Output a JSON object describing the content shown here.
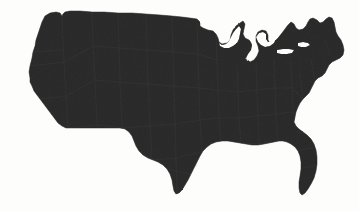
{
  "figure": {
    "kind": "map-image",
    "subject": "Contiguous United States",
    "title": "",
    "caption": "",
    "alt_text": "Solid dark silhouette map of the contiguous United States with faint state boundary lines"
  },
  "canvas": {
    "width": 359,
    "height": 212,
    "background_color": "#fdfdfc"
  },
  "style": {
    "land_fill_color": "#333333",
    "land_fill_color_dark": "#262626",
    "state_border_color": "#5a5a5a",
    "state_border_width": 0.6,
    "water_color": "#fdfdfc",
    "outline_color": "#2b2b2b",
    "texture": "noisy-dithered-scan"
  },
  "extent": {
    "left_px": 27,
    "top_px": 11,
    "right_px": 345,
    "bottom_px": 196
  },
  "features": {
    "landmass_label": "contiguous-united-states",
    "visible_landmarks": [
      "Puget Sound notch",
      "California coastline",
      "Baja California notch",
      "Gulf of Mexico coastline",
      "Texas southern tip",
      "Florida peninsula",
      "Chesapeake Bay",
      "Cape Cod",
      "Long Island",
      "Maine northeast projection",
      "Great Lakes"
    ],
    "great_lakes": [
      "Lake Superior",
      "Lake Michigan",
      "Lake Huron",
      "Lake Erie",
      "Lake Ontario"
    ],
    "state_borders_visible": true,
    "state_labels_visible": false,
    "legend_visible": false,
    "scale_bar_visible": false,
    "compass_visible": false
  },
  "paths": {
    "national_outline": "M 30 78 L 29 72 L 30 66 L 32 58 L 33 52 L 35 46 L 36 40 L 38 34 L 40 28 L 42 22 L 45 16 L 50 13 L 56 12 L 60 13 L 62 16 L 63 14 L 65 12 L 70 11 L 80 11 L 92 12 L 104 12 L 118 13 L 132 13 L 146 14 L 160 15 L 172 16 L 182 17 L 190 18 L 197 19 L 200 22 L 200 26 L 203 28 L 208 30 L 213 31 L 216 34 L 218 38 L 219 42 L 222 44 L 227 43 L 230 40 L 231 35 L 233 30 L 236 26 L 240 23 L 243 21 L 245 24 L 244 29 L 243 34 L 245 38 L 249 40 L 252 43 L 254 47 L 253 52 L 250 56 L 248 60 L 250 62 L 254 60 L 257 56 L 259 51 L 258 46 L 256 41 L 256 36 L 258 32 L 262 30 L 266 31 L 268 35 L 268 40 L 270 43 L 274 42 L 278 38 L 282 33 L 285 29 L 288 25 L 291 22 L 294 24 L 296 28 L 299 30 L 303 29 L 306 26 L 308 22 L 310 19 L 313 18 L 317 20 L 320 23 L 323 22 L 326 19 L 329 17 L 332 18 L 334 22 L 335 27 L 336 32 L 338 36 L 341 40 L 343 45 L 344 50 L 343 55 L 340 58 L 336 60 L 332 62 L 329 65 L 327 69 L 325 73 L 322 76 L 318 78 L 315 81 L 313 85 L 311 89 L 309 93 L 306 96 L 303 99 L 300 103 L 298 107 L 296 112 L 295 117 L 294 122 L 296 126 L 299 129 L 303 132 L 307 135 L 311 139 L 314 144 L 316 150 L 317 157 L 317 164 L 316 171 L 314 178 L 311 184 L 308 189 L 305 193 L 302 195 L 300 193 L 299 188 L 299 182 L 300 176 L 301 169 L 301 162 L 300 156 L 298 151 L 295 147 L 291 144 L 287 142 L 283 141 L 279 141 L 274 142 L 269 143 L 264 144 L 258 145 L 252 145 L 246 144 L 240 143 L 234 142 L 228 141 L 222 141 L 216 142 L 211 144 L 207 147 L 203 151 L 200 156 L 197 162 L 194 168 L 191 174 L 188 180 L 185 185 L 182 190 L 179 193 L 176 194 L 174 191 L 173 186 L 172 180 L 170 174 L 167 169 L 163 165 L 158 162 L 153 160 L 148 158 L 143 155 L 139 151 L 136 146 L 134 141 L 132 136 L 129 132 L 125 129 L 120 128 L 114 128 L 108 128 L 102 128 L 96 128 L 90 128 L 84 128 L 78 128 L 72 128 L 66 128 L 62 126 L 58 123 L 55 119 L 52 115 L 49 111 L 46 107 L 43 103 L 40 99 L 37 95 L 34 91 L 32 86 L 30 82 Z",
    "great_lakes_voids": [
      "M 219 43 L 222 45 L 226 44 L 229 41 L 231 37 L 233 33 L 236 29 L 239 26 L 241 29 L 240 34 L 239 39 L 237 43 L 233 46 L 229 48 L 224 48 L 220 46 Z",
      "M 244 33 L 247 36 L 250 40 L 252 45 L 251 50 L 248 54 L 246 58 L 247 61 L 251 59 L 254 55 L 256 50 L 255 44 L 253 39 L 250 35 L 247 32 Z",
      "M 256 37 L 259 33 L 263 32 L 266 34 L 266 39 L 268 42 L 272 41 L 276 38 L 274 43 L 270 46 L 265 47 L 261 45 L 258 42 Z",
      "M 277 50 L 283 49 L 289 49 L 294 50 L 292 53 L 287 54 L 281 54 L 277 53 Z",
      "M 298 43 L 303 42 L 308 43 L 310 45 L 306 47 L 301 47 L 298 46 Z"
    ],
    "state_borders": [
      "M 62 14 L 63 40 L 64 62",
      "M 30 66 L 64 62",
      "M 33 52 L 62 50",
      "M 64 62 L 66 96",
      "M 40 99 L 66 96",
      "M 66 96 L 68 128",
      "M 92 12 L 93 46",
      "M 64 62 L 93 46",
      "M 93 46 L 95 80",
      "M 66 96 L 95 80",
      "M 95 80 L 97 125",
      "M 68 128 L 97 125",
      "M 118 13 L 119 48",
      "M 93 46 L 119 48",
      "M 119 48 L 120 82",
      "M 95 80 L 120 82",
      "M 120 82 L 122 128",
      "M 97 125 L 122 128",
      "M 146 14 L 147 50",
      "M 119 48 L 147 50",
      "M 147 50 L 148 84",
      "M 120 82 L 148 84",
      "M 148 84 L 150 126",
      "M 122 128 L 150 126",
      "M 150 126 L 152 160",
      "M 172 16 L 173 52",
      "M 147 50 L 173 52",
      "M 173 52 L 174 86",
      "M 148 84 L 174 86",
      "M 174 86 L 175 124",
      "M 150 126 L 175 124",
      "M 175 124 L 176 158",
      "M 152 160 L 176 158",
      "M 176 158 L 177 192",
      "M 197 19 L 198 54",
      "M 173 52 L 198 54",
      "M 198 54 L 199 88",
      "M 174 86 L 199 88",
      "M 199 88 L 200 120",
      "M 175 124 L 200 120",
      "M 200 120 L 202 152",
      "M 176 158 L 202 152",
      "M 216 34 L 217 60",
      "M 198 54 L 217 60",
      "M 217 60 L 218 90",
      "M 199 88 L 218 90",
      "M 218 90 L 219 118",
      "M 200 120 L 219 118",
      "M 219 118 L 221 144",
      "M 202 152 L 221 144",
      "M 237 65 L 238 92",
      "M 218 90 L 238 92",
      "M 238 92 L 239 118",
      "M 219 118 L 239 118",
      "M 239 118 L 241 143",
      "M 221 144 L 241 143",
      "M 256 62 L 257 90",
      "M 238 92 L 257 90",
      "M 257 90 L 258 116",
      "M 239 118 L 258 116",
      "M 258 116 L 259 144",
      "M 241 143 L 259 144",
      "M 274 60 L 275 88",
      "M 257 90 L 275 88",
      "M 275 88 L 276 114",
      "M 258 116 L 276 114",
      "M 276 114 L 278 141",
      "M 259 144 L 278 141",
      "M 291 62 L 292 88",
      "M 275 88 L 292 88",
      "M 292 88 L 293 112",
      "M 276 114 L 293 112",
      "M 293 112 L 296 126",
      "M 300 74 L 303 99",
      "M 292 88 L 303 99",
      "M 311 60 L 315 81",
      "M 325 40 L 330 56",
      "M 297 132 L 305 133",
      "M 300 150 L 312 148",
      "M 303 168 L 315 166",
      "M 185 185 L 200 156",
      "M 167 169 L 191 174",
      "M 139 151 L 163 165"
    ]
  }
}
